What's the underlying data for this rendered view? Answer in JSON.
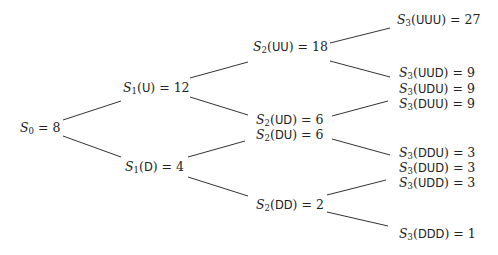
{
  "diagram": {
    "line_color": "#333333",
    "text_color": "#222222",
    "nodes": {
      "s0": {
        "symbol": "S",
        "sub": "0",
        "path": "",
        "value": "8",
        "x": 20,
        "y": 128
      },
      "s1_u": {
        "symbol": "S",
        "sub": "1",
        "path": "U",
        "value": "12",
        "x": 123,
        "y": 88
      },
      "s1_d": {
        "symbol": "S",
        "sub": "1",
        "path": "D",
        "value": "4",
        "x": 125,
        "y": 167
      },
      "s2_uu": {
        "symbol": "S",
        "sub": "2",
        "path": "UU",
        "value": "18",
        "x": 253,
        "y": 47
      },
      "s2_ud": {
        "symbol": "S",
        "sub": "2",
        "path": "UD",
        "value": "6",
        "x": 256,
        "y": 120
      },
      "s2_du": {
        "symbol": "S",
        "sub": "2",
        "path": "DU",
        "value": "6",
        "x": 256,
        "y": 135
      },
      "s2_dd": {
        "symbol": "S",
        "sub": "2",
        "path": "DD",
        "value": "2",
        "x": 256,
        "y": 205
      },
      "s3_uuu": {
        "symbol": "S",
        "sub": "3",
        "path": "UUU",
        "value": "27",
        "x": 397,
        "y": 20
      },
      "s3_uud": {
        "symbol": "S",
        "sub": "3",
        "path": "UUD",
        "value": "9",
        "x": 399,
        "y": 73
      },
      "s3_udu": {
        "symbol": "S",
        "sub": "3",
        "path": "UDU",
        "value": "9",
        "x": 399,
        "y": 89
      },
      "s3_duu": {
        "symbol": "S",
        "sub": "3",
        "path": "DUU",
        "value": "9",
        "x": 399,
        "y": 104
      },
      "s3_ddu": {
        "symbol": "S",
        "sub": "3",
        "path": "DDU",
        "value": "3",
        "x": 399,
        "y": 153
      },
      "s3_dud": {
        "symbol": "S",
        "sub": "3",
        "path": "DUD",
        "value": "3",
        "x": 399,
        "y": 168
      },
      "s3_udd": {
        "symbol": "S",
        "sub": "3",
        "path": "UDD",
        "value": "3",
        "x": 399,
        "y": 183
      },
      "s3_ddd": {
        "symbol": "S",
        "sub": "3",
        "path": "DDD",
        "value": "1",
        "x": 399,
        "y": 234
      }
    },
    "edges": [
      {
        "from": "s0",
        "to": "s1_u",
        "x1": 63,
        "y1": 120,
        "x2": 121,
        "y2": 101
      },
      {
        "from": "s0",
        "to": "s1_d",
        "x1": 63,
        "y1": 136,
        "x2": 121,
        "y2": 157
      },
      {
        "from": "s1_u",
        "to": "s2_uu",
        "x1": 190,
        "y1": 78,
        "x2": 248,
        "y2": 62
      },
      {
        "from": "s1_u",
        "to": "s2_ud",
        "x1": 190,
        "y1": 97,
        "x2": 248,
        "y2": 115
      },
      {
        "from": "s1_d",
        "to": "s2_du",
        "x1": 188,
        "y1": 157,
        "x2": 245,
        "y2": 141
      },
      {
        "from": "s1_d",
        "to": "s2_dd",
        "x1": 188,
        "y1": 177,
        "x2": 248,
        "y2": 196
      },
      {
        "from": "s2_uu",
        "to": "s3_uuu",
        "x1": 330,
        "y1": 43,
        "x2": 390,
        "y2": 28
      },
      {
        "from": "s2_uu",
        "to": "s3_uud",
        "x1": 330,
        "y1": 61,
        "x2": 390,
        "y2": 77
      },
      {
        "from": "s2_ud",
        "to": "s3_duu",
        "x1": 332,
        "y1": 116,
        "x2": 388,
        "y2": 101
      },
      {
        "from": "s2_du",
        "to": "s3_ddu",
        "x1": 332,
        "y1": 139,
        "x2": 390,
        "y2": 155
      },
      {
        "from": "s2_dd",
        "to": "s3_udd",
        "x1": 327,
        "y1": 195,
        "x2": 386,
        "y2": 180
      },
      {
        "from": "s2_dd",
        "to": "s3_ddd",
        "x1": 327,
        "y1": 212,
        "x2": 388,
        "y2": 226
      }
    ]
  }
}
